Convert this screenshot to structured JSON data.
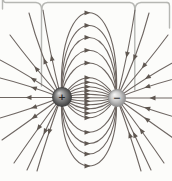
{
  "figure": {
    "name": "electric-dipole-field-lines",
    "background": "#fcfcfa",
    "line_color": "#6e6662",
    "arrow_color": "#5f5751",
    "line_width": 1.1,
    "arrow_points": "-4.5,-2.4 1.5,0 -4.5,2.4",
    "callout": {
      "color": "#b6b7b3",
      "width": 1.4,
      "paths": [
        "M2.5,0 L2.5,9",
        "M167,2.5 Q169.5,2.5 169.5,6 L169.5,28",
        "M3.5,0 Q3.5,2.5 6,2.5 L36,2.5 Q41.5,3 41.5,9 L41.5,86",
        "M41.9,9 Q41.9,3 47.5,2.5 L130,2.5 Q134.8,3 134.8,9 L134.8,90",
        "M135.2,9 Q135.2,3 141,2.5 L167,2.5"
      ]
    },
    "charges": [
      {
        "id": "positive-charge",
        "sign": "+",
        "sign_color": "#262626",
        "cx": 62,
        "cy": 97,
        "r": 10,
        "gradient": {
          "id": "grad-pos",
          "fx": 0.35,
          "fy": 0.3,
          "stops": [
            [
              "0%",
              "#d9d9d9"
            ],
            [
              "45%",
              "#8f8f8f"
            ],
            [
              "100%",
              "#3a3a3a"
            ]
          ]
        }
      },
      {
        "id": "negative-charge",
        "sign": "−",
        "sign_color": "#3a3a3a",
        "cx": 117,
        "cy": 98,
        "r": 9,
        "gradient": {
          "id": "grad-neg",
          "fx": 0.35,
          "fy": 0.3,
          "stops": [
            [
              "0%",
              "#f7f7f7"
            ],
            [
              "50%",
              "#cfcfcf"
            ],
            [
              "100%",
              "#8a8a8a"
            ]
          ]
        }
      }
    ],
    "field_lines": [
      {
        "d": "M62,97.5 Q89,57.75 116,98",
        "arrow": {
          "x": 89,
          "y": 77.75,
          "a": 0
        }
      },
      {
        "d": "M62,97.5 Q89,66.75 116,98",
        "arrow": {
          "x": 89,
          "y": 82.25,
          "a": 0
        }
      },
      {
        "d": "M62,97.5 Q89,75.75 116,98",
        "arrow": {
          "x": 89,
          "y": 86.75,
          "a": 0
        }
      },
      {
        "d": "M62,97.5 Q89,83.75 116,98",
        "arrow": {
          "x": 89,
          "y": 90.75,
          "a": 0
        }
      },
      {
        "d": "M62,97.5 Q89,90.75 116,98",
        "arrow": {
          "x": 89,
          "y": 94.25,
          "a": 0
        }
      },
      {
        "d": "M62,97.5 L116,98",
        "arrow": {
          "x": 89,
          "y": 97.75,
          "a": 0
        }
      },
      {
        "d": "M62,97.5 Q89,104.75 116,98",
        "arrow": {
          "x": 89,
          "y": 101.25,
          "a": 0
        }
      },
      {
        "d": "M62,97.5 Q89,111.75 116,98",
        "arrow": {
          "x": 89,
          "y": 104.75,
          "a": 0
        }
      },
      {
        "d": "M62,97.5 Q89,119.75 116,98",
        "arrow": {
          "x": 89,
          "y": 108.75,
          "a": 0
        }
      },
      {
        "d": "M62,97.5 Q89,128.75 116,98",
        "arrow": {
          "x": 89,
          "y": 113.25,
          "a": 0
        }
      },
      {
        "d": "M62,97.5 Q89,137.75 116,98",
        "arrow": {
          "x": 89,
          "y": 117.75,
          "a": 0
        }
      },
      {
        "d": "M61.5,93 C73,53 105,53 116.5,93",
        "arrow": {
          "x": 89,
          "y": 63,
          "a": 0
        }
      },
      {
        "d": "M61.5,93 C68,36 110,36 116.5,93",
        "arrow": {
          "x": 89,
          "y": 50.3,
          "a": 0
        }
      },
      {
        "d": "M61.5,93 C64,19 114,19 116.5,93",
        "arrow": {
          "x": 89,
          "y": 37.5,
          "a": 0
        }
      },
      {
        "d": "M61.5,93 C61,3 117,3 116.5,93",
        "arrow": {
          "x": 89,
          "y": 25.5,
          "a": 0
        }
      },
      {
        "d": "M61.5,93 C58,-14 120,-14 116.5,93",
        "arrow": {
          "x": 89,
          "y": 12.8,
          "a": 0
        }
      },
      {
        "d": "M61.5,103 C73,142 105,142 116.5,103",
        "arrow": {
          "x": 89,
          "y": 132.3,
          "a": 0
        }
      },
      {
        "d": "M61.5,103 C68,157 110,157 116.5,103",
        "arrow": {
          "x": 89,
          "y": 143.5,
          "a": 0
        }
      },
      {
        "d": "M61.5,103 C64,171 114,171 116.5,103",
        "arrow": {
          "x": 89,
          "y": 154,
          "a": 0
        }
      },
      {
        "d": "M61.5,103 C60,187 118,187 116.5,103",
        "arrow": {
          "x": 89,
          "y": 166,
          "a": 0
        }
      },
      {
        "d": "M61,97.5 Q40,55 29,13",
        "arrow": {
          "x": 44.1,
          "y": 59.4,
          "a": -111
        }
      },
      {
        "d": "M61,97.5 Q49,50 43,10",
        "arrow": {
          "x": 51.4,
          "y": 56.3,
          "a": -102
        }
      },
      {
        "d": "M61,97.5 Q30,62 10,35",
        "arrow": {
          "x": 35.3,
          "y": 67.3,
          "a": -129
        }
      },
      {
        "d": "M61,97.5 Q27,74 0,60",
        "arrow": {
          "x": 31.8,
          "y": 78.3,
          "a": -148
        }
      },
      {
        "d": "M61,97.5 Q28,85 0,78",
        "arrow": {
          "x": 32.3,
          "y": 87.4,
          "a": -162
        }
      },
      {
        "d": "M61,97.5 L0,97.5",
        "arrow": {
          "x": 27,
          "y": 97.5,
          "a": 180
        }
      },
      {
        "d": "M61,97.5 Q28,110 0,118",
        "arrow": {
          "x": 32.3,
          "y": 107.8,
          "a": 163
        }
      },
      {
        "d": "M61,97.5 Q28,122 2,140",
        "arrow": {
          "x": 32.7,
          "y": 118.2,
          "a": 144
        }
      },
      {
        "d": "M61,97.5 Q33,135 14,163",
        "arrow": {
          "x": 37.6,
          "y": 129.3,
          "a": 126
        }
      },
      {
        "d": "M61,97.5 Q41,140 27,170",
        "arrow": {
          "x": 44.2,
          "y": 133.2,
          "a": 115
        }
      },
      {
        "d": "M61,97.5 Q46,140 37,171",
        "arrow": {
          "x": 48.7,
          "y": 133.4,
          "a": 108
        }
      },
      {
        "d": "M117,98 Q138,55 149,13",
        "arrow": {
          "x": 133.9,
          "y": 59.4,
          "a": 111
        }
      },
      {
        "d": "M117,98 Q129,50 135,10",
        "arrow": {
          "x": 126.6,
          "y": 56.3,
          "a": 102
        }
      },
      {
        "d": "M117,98 Q148,62 168,35",
        "arrow": {
          "x": 142.7,
          "y": 67.3,
          "a": 129
        }
      },
      {
        "d": "M117,98 Q151,74 178,60",
        "arrow": {
          "x": 146.2,
          "y": 78.3,
          "a": 148
        }
      },
      {
        "d": "M117,98 Q150,85 178,78",
        "arrow": {
          "x": 145.7,
          "y": 87.4,
          "a": 162
        }
      },
      {
        "d": "M117,98 L172,98",
        "arrow": {
          "x": 151,
          "y": 98,
          "a": 180
        }
      },
      {
        "d": "M117,98 Q150,110 178,118",
        "arrow": {
          "x": 145.7,
          "y": 107.8,
          "a": -163
        }
      },
      {
        "d": "M117,98 Q150,122 176,140",
        "arrow": {
          "x": 145.3,
          "y": 118.2,
          "a": -144
        }
      },
      {
        "d": "M117,98 Q145,135 164,163",
        "arrow": {
          "x": 140.4,
          "y": 129.3,
          "a": -126
        }
      },
      {
        "d": "M117,98 Q137,140 151,170",
        "arrow": {
          "x": 133.8,
          "y": 133.2,
          "a": -115
        }
      },
      {
        "d": "M117,98 Q132,140 141,171",
        "arrow": {
          "x": 129.3,
          "y": 133.4,
          "a": -108
        }
      }
    ]
  }
}
